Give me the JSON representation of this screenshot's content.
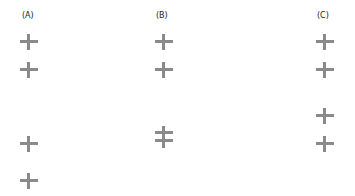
{
  "panels": [
    {
      "label": "(A)",
      "markers": 4
    },
    {
      "label": "(B)",
      "markers": 4,
      "note": "lower two markers overlap on a shared vertical"
    },
    {
      "label": "(C)",
      "markers": 4
    }
  ],
  "marker_color": "#8a8a8a"
}
